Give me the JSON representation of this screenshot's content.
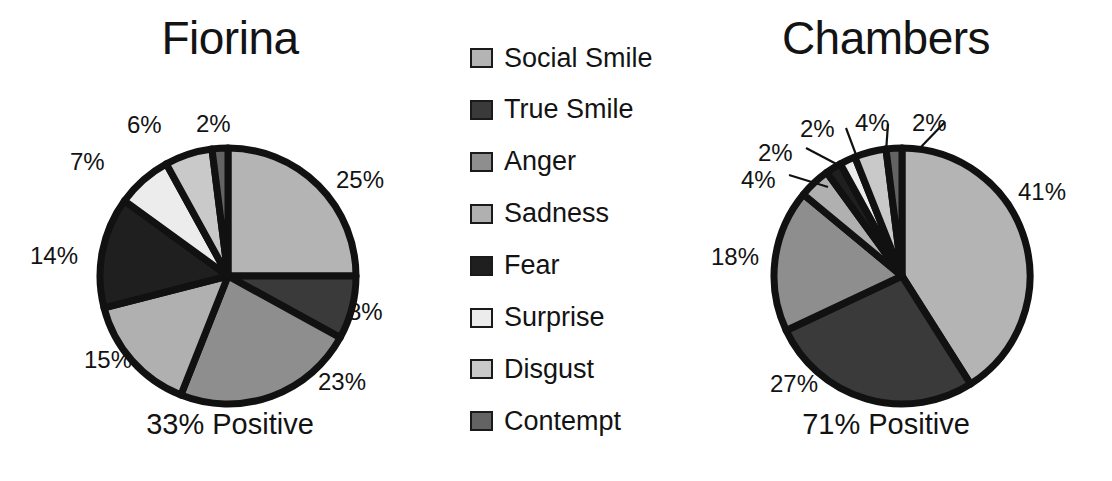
{
  "legend": {
    "items": [
      {
        "label": "Social Smile",
        "color": "#b4b4b4"
      },
      {
        "label": "True Smile",
        "color": "#3a3a3a"
      },
      {
        "label": "Anger",
        "color": "#8e8e8e"
      },
      {
        "label": "Sadness",
        "color": "#b0b0b0"
      },
      {
        "label": "Fear",
        "color": "#1f1f1f"
      },
      {
        "label": "Surprise",
        "color": "#ececec"
      },
      {
        "label": "Disgust",
        "color": "#c9c9c9"
      },
      {
        "label": "Contempt",
        "color": "#636363"
      }
    ]
  },
  "chart_data": [
    {
      "type": "pie",
      "title": "Fiorina",
      "caption": "33% Positive",
      "start_angle_deg": 0,
      "direction": "clockwise",
      "center": [
        228,
        276
      ],
      "radius": 128,
      "categories": [
        "Social Smile",
        "True Smile",
        "Anger",
        "Sadness",
        "Fear",
        "Surprise",
        "Disgust",
        "Contempt"
      ],
      "values": [
        25,
        8,
        23,
        15,
        14,
        7,
        6,
        2
      ],
      "colors": [
        "#b4b4b4",
        "#3a3a3a",
        "#8e8e8e",
        "#b0b0b0",
        "#1f1f1f",
        "#ececec",
        "#c9c9c9",
        "#636363"
      ],
      "tick_labels": [
        "25%",
        "8%",
        "23%",
        "15%",
        "14%",
        "7%",
        "6%",
        "2%"
      ],
      "label_positions": [
        {
          "text": "25%",
          "x": 336,
          "y": 168
        },
        {
          "text": "8%",
          "x": 348,
          "y": 300
        },
        {
          "text": "23%",
          "x": 318,
          "y": 370
        },
        {
          "text": "15%",
          "x": 84,
          "y": 348
        },
        {
          "text": "14%",
          "x": 30,
          "y": 244
        },
        {
          "text": "7%",
          "x": 70,
          "y": 150
        },
        {
          "text": "6%",
          "x": 127,
          "y": 113
        },
        {
          "text": "2%",
          "x": 196,
          "y": 112
        }
      ],
      "leaders": []
    },
    {
      "type": "pie",
      "title": "Chambers",
      "caption": "71% Positive",
      "start_angle_deg": 0,
      "direction": "clockwise",
      "center": [
        902,
        276
      ],
      "radius": 128,
      "categories": [
        "Social Smile",
        "True Smile",
        "Anger",
        "Sadness",
        "Fear",
        "Surprise",
        "Disgust",
        "Contempt"
      ],
      "values": [
        41,
        27,
        18,
        4,
        2,
        2,
        4,
        2
      ],
      "colors": [
        "#b4b4b4",
        "#3a3a3a",
        "#8e8e8e",
        "#b0b0b0",
        "#1f1f1f",
        "#ececec",
        "#c9c9c9",
        "#636363"
      ],
      "tick_labels": [
        "41%",
        "27%",
        "18%",
        "4%",
        "2%",
        "2%",
        "4%",
        "2%"
      ],
      "label_positions": [
        {
          "text": "41%",
          "x": 1018,
          "y": 180
        },
        {
          "text": "27%",
          "x": 770,
          "y": 372
        },
        {
          "text": "18%",
          "x": 711,
          "y": 245
        },
        {
          "text": "4%",
          "x": 741,
          "y": 168
        },
        {
          "text": "2%",
          "x": 758,
          "y": 141
        },
        {
          "text": "2%",
          "x": 800,
          "y": 117
        },
        {
          "text": "4%",
          "x": 855,
          "y": 111
        },
        {
          "text": "2%",
          "x": 912,
          "y": 111
        }
      ],
      "leaders": [
        {
          "x1": 789,
          "y1": 175,
          "x2": 828,
          "y2": 187
        },
        {
          "x1": 806,
          "y1": 148,
          "x2": 844,
          "y2": 168
        },
        {
          "x1": 846,
          "y1": 128,
          "x2": 858,
          "y2": 160
        },
        {
          "x1": 888,
          "y1": 124,
          "x2": 886,
          "y2": 152
        },
        {
          "x1": 945,
          "y1": 122,
          "x2": 920,
          "y2": 148
        }
      ]
    }
  ]
}
